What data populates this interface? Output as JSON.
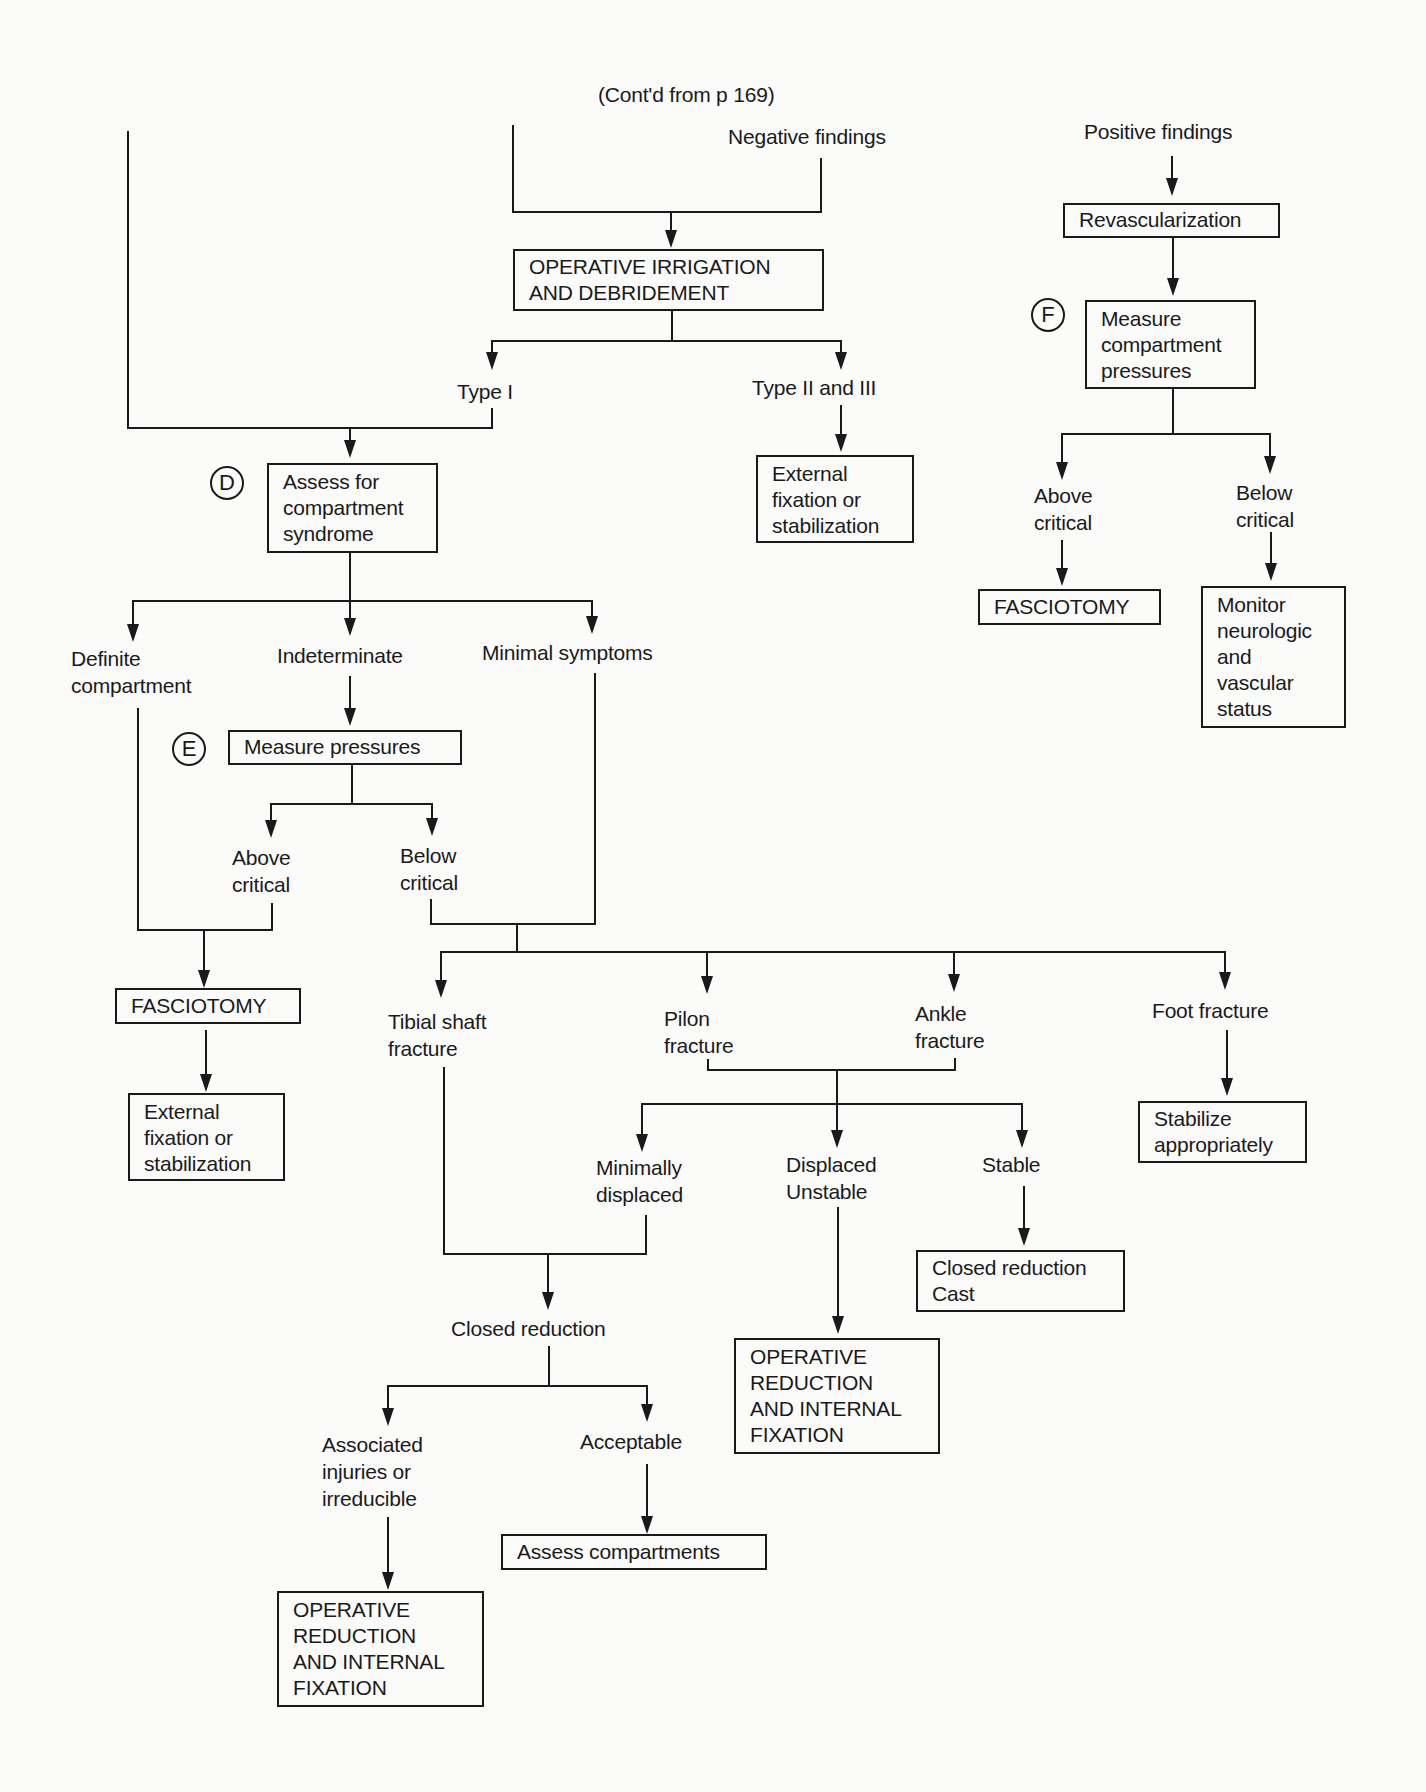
{
  "header": {
    "continued": "(Cont'd from p 169)"
  },
  "nodes": {
    "negative_findings": "Negative findings",
    "positive_findings": "Positive findings",
    "irrigation": [
      "OPERATIVE IRRIGATION",
      "AND DEBRIDEMENT"
    ],
    "type_i": "Type I",
    "type_ii_iii": "Type II and III",
    "ext_fix_1": [
      "External",
      "fixation or",
      "stabilization"
    ],
    "assess_compartment": [
      "Assess for",
      "compartment",
      "syndrome"
    ],
    "revascularization": "Revascularization",
    "measure_compartment": [
      "Measure",
      "compartment",
      "pressures"
    ],
    "f_above_critical": [
      "Above",
      "critical"
    ],
    "f_below_critical": [
      "Below",
      "critical"
    ],
    "f_fasciotomy": "FASCIOTOMY",
    "monitor": [
      "Monitor",
      "neurologic",
      "and",
      "vascular",
      "status"
    ],
    "definite": [
      "Definite",
      "compartment"
    ],
    "indeterminate": "Indeterminate",
    "minimal": "Minimal symptoms",
    "measure_pressures": "Measure pressures",
    "e_above_critical": [
      "Above",
      "critical"
    ],
    "e_below_critical": [
      "Below",
      "critical"
    ],
    "e_fasciotomy": "FASCIOTOMY",
    "ext_fix_2": [
      "External",
      "fixation or",
      "stabilization"
    ],
    "tibial": [
      "Tibial shaft",
      "fracture"
    ],
    "pilon": [
      "Pilon",
      "fracture"
    ],
    "ankle": [
      "Ankle",
      "fracture"
    ],
    "foot": "Foot fracture",
    "stabilize": [
      "Stabilize",
      "appropriately"
    ],
    "min_displaced": [
      "Minimally",
      "displaced"
    ],
    "displaced_unstable": [
      "Displaced",
      "Unstable"
    ],
    "stable": "Stable",
    "closed_cast": [
      "Closed reduction",
      "Cast"
    ],
    "orif_1": [
      "OPERATIVE",
      "REDUCTION",
      "AND INTERNAL",
      "FIXATION"
    ],
    "closed_reduction": "Closed reduction",
    "associated": [
      "Associated",
      "injuries or",
      "irreducible"
    ],
    "acceptable": "Acceptable",
    "assess_compartments": "Assess compartments",
    "orif_2": [
      "OPERATIVE",
      "REDUCTION",
      "AND INTERNAL",
      "FIXATION"
    ]
  },
  "step_markers": {
    "d": "D",
    "e": "E",
    "f": "F"
  }
}
